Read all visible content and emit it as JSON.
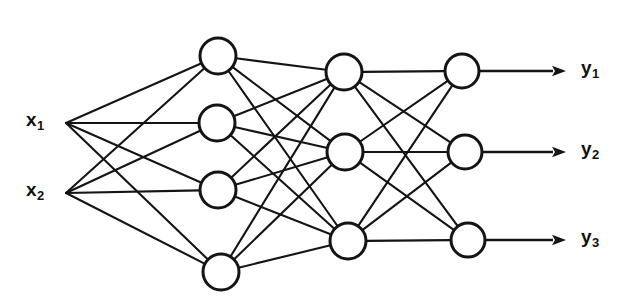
{
  "figure": {
    "background_color": "#ffffff",
    "stroke_color": "#141414",
    "node_fill_color": "#ffffff",
    "width": 636,
    "height": 307
  },
  "inputs": [
    {
      "id": "x1",
      "base": "x",
      "sub": "1",
      "label": "x1",
      "x": 66,
      "y": 123,
      "label_x": 26,
      "label_y": 110
    },
    {
      "id": "x2",
      "base": "x",
      "sub": "2",
      "label": "x2",
      "x": 66,
      "y": 193,
      "label_x": 26,
      "label_y": 180
    }
  ],
  "outputs": [
    {
      "id": "y1",
      "base": "y",
      "sub": "1",
      "label": "y1",
      "arrow_start_x": 480,
      "arrow_tip_x": 566,
      "y": 71,
      "label_x": 581,
      "label_y": 58
    },
    {
      "id": "y2",
      "base": "y",
      "sub": "2",
      "label": "y2",
      "arrow_start_x": 483,
      "arrow_tip_x": 566,
      "y": 152,
      "label_x": 581,
      "label_y": 139
    },
    {
      "id": "y3",
      "base": "y",
      "sub": "3",
      "label": "y3",
      "arrow_start_x": 486,
      "arrow_tip_x": 566,
      "y": 240,
      "label_x": 581,
      "label_y": 227
    }
  ],
  "layers": [
    {
      "name": "hidden-layer-1",
      "index": 1,
      "node_count": 4,
      "radius": 18,
      "nodes": [
        {
          "id": "h1-1",
          "x": 218,
          "y": 56
        },
        {
          "id": "h1-2",
          "x": 217,
          "y": 123
        },
        {
          "id": "h1-3",
          "x": 218,
          "y": 190
        },
        {
          "id": "h1-4",
          "x": 221,
          "y": 272
        }
      ]
    },
    {
      "name": "hidden-layer-2",
      "index": 2,
      "node_count": 3,
      "radius": 18,
      "nodes": [
        {
          "id": "h2-1",
          "x": 344,
          "y": 72
        },
        {
          "id": "h2-2",
          "x": 345,
          "y": 152
        },
        {
          "id": "h2-3",
          "x": 348,
          "y": 241
        }
      ]
    },
    {
      "name": "output-layer",
      "index": 3,
      "node_count": 3,
      "radius": 17,
      "nodes": [
        {
          "id": "o-1",
          "x": 462,
          "y": 71
        },
        {
          "id": "o-2",
          "x": 465,
          "y": 152
        },
        {
          "id": "o-3",
          "x": 468,
          "y": 240
        }
      ]
    }
  ],
  "connections": {
    "input_to_hidden1": "fully-connected",
    "hidden1_to_hidden2": "fully-connected",
    "hidden2_to_output": "fully-connected"
  },
  "chart_data": {
    "type": "diagram",
    "layer_sizes": [
      2,
      4,
      3,
      3
    ],
    "layer_names": [
      "input",
      "hidden-layer-1",
      "hidden-layer-2",
      "output"
    ],
    "input_labels": [
      "x1",
      "x2"
    ],
    "output_labels": [
      "y1",
      "y2",
      "y3"
    ],
    "connectivity": "fully-connected between all adjacent layers"
  }
}
